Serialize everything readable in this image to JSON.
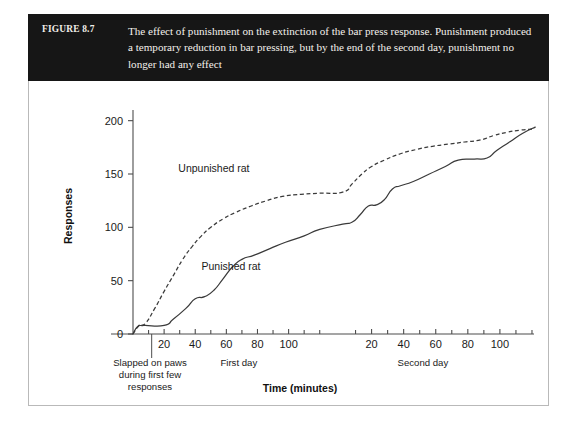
{
  "figure": {
    "number_label": "FIGURE 8.7",
    "caption": "The effect of punishment on the extinction of the bar press response. Punishment produced a temporary reduction in bar pressing, but by the end of the second day, punishment no longer had any effect",
    "header_bg": "#161616",
    "header_text_color": "#f4f1ec",
    "frame_border_color": "#b9b9b9"
  },
  "chart_data": {
    "type": "line",
    "title": "",
    "xlabel": "Time (minutes)",
    "ylabel": "Responses",
    "ylim": [
      0,
      210
    ],
    "yticks": [
      0,
      50,
      100,
      150,
      200
    ],
    "ytick_labels": [
      "0",
      "50",
      "100",
      "150",
      "200"
    ],
    "grid": false,
    "legend": "inline-annotations",
    "x_segments": [
      {
        "name": "First day",
        "label": "First day",
        "xlim": [
          0,
          125
        ],
        "ticks": [
          20,
          40,
          60,
          80,
          100
        ],
        "tick_labels": [
          "20",
          "40",
          "60",
          "80",
          "100"
        ],
        "minor_ticks": [
          10,
          30,
          50,
          70,
          90,
          110,
          120
        ]
      },
      {
        "name": "Second day",
        "label": "Second day",
        "xlim": [
          0,
          125
        ],
        "ticks": [
          20,
          40,
          60,
          80,
          100
        ],
        "tick_labels": [
          "20",
          "40",
          "60",
          "80",
          "100"
        ],
        "minor_ticks": [
          10,
          30,
          50,
          70,
          90,
          110,
          120
        ]
      }
    ],
    "annotations": [
      {
        "name": "slapped-note",
        "lines": [
          "Slapped on paws",
          "during first few",
          "responses"
        ],
        "points_to_day": "First day",
        "points_to_x": 12
      }
    ],
    "series": [
      {
        "name": "Unpunished rat",
        "label": "Unpunished rat",
        "style": "dashed",
        "color": "#3a3a3a",
        "label_position": {
          "day": "First day",
          "x": 52,
          "y": 152
        },
        "points": [
          {
            "day": 1,
            "x": 0,
            "y": 0
          },
          {
            "day": 1,
            "x": 4,
            "y": 8
          },
          {
            "day": 1,
            "x": 8,
            "y": 10
          },
          {
            "day": 1,
            "x": 14,
            "y": 24
          },
          {
            "day": 1,
            "x": 20,
            "y": 40
          },
          {
            "day": 1,
            "x": 26,
            "y": 55
          },
          {
            "day": 1,
            "x": 32,
            "y": 70
          },
          {
            "day": 1,
            "x": 38,
            "y": 82
          },
          {
            "day": 1,
            "x": 44,
            "y": 92
          },
          {
            "day": 1,
            "x": 50,
            "y": 100
          },
          {
            "day": 1,
            "x": 58,
            "y": 108
          },
          {
            "day": 1,
            "x": 66,
            "y": 114
          },
          {
            "day": 1,
            "x": 76,
            "y": 120
          },
          {
            "day": 1,
            "x": 86,
            "y": 125
          },
          {
            "day": 1,
            "x": 96,
            "y": 129
          },
          {
            "day": 1,
            "x": 108,
            "y": 131
          },
          {
            "day": 1,
            "x": 120,
            "y": 132
          },
          {
            "day": 2,
            "x": 2,
            "y": 133
          },
          {
            "day": 2,
            "x": 8,
            "y": 141
          },
          {
            "day": 2,
            "x": 14,
            "y": 150
          },
          {
            "day": 2,
            "x": 20,
            "y": 157
          },
          {
            "day": 2,
            "x": 28,
            "y": 163
          },
          {
            "day": 2,
            "x": 38,
            "y": 169
          },
          {
            "day": 2,
            "x": 48,
            "y": 173
          },
          {
            "day": 2,
            "x": 58,
            "y": 176
          },
          {
            "day": 2,
            "x": 68,
            "y": 178
          },
          {
            "day": 2,
            "x": 78,
            "y": 180
          },
          {
            "day": 2,
            "x": 88,
            "y": 182
          },
          {
            "day": 2,
            "x": 96,
            "y": 186
          },
          {
            "day": 2,
            "x": 104,
            "y": 189
          },
          {
            "day": 2,
            "x": 112,
            "y": 191
          },
          {
            "day": 2,
            "x": 120,
            "y": 192
          }
        ]
      },
      {
        "name": "Punished rat",
        "label": "Punished rat",
        "style": "solid",
        "color": "#3a3a3a",
        "label_position": {
          "day": "First day",
          "x": 63,
          "y": 60
        },
        "points": [
          {
            "day": 1,
            "x": 0,
            "y": 0
          },
          {
            "day": 1,
            "x": 3,
            "y": 7
          },
          {
            "day": 1,
            "x": 7,
            "y": 8
          },
          {
            "day": 1,
            "x": 20,
            "y": 8
          },
          {
            "day": 1,
            "x": 26,
            "y": 14
          },
          {
            "day": 1,
            "x": 34,
            "y": 24
          },
          {
            "day": 1,
            "x": 40,
            "y": 33
          },
          {
            "day": 1,
            "x": 46,
            "y": 35
          },
          {
            "day": 1,
            "x": 52,
            "y": 41
          },
          {
            "day": 1,
            "x": 58,
            "y": 52
          },
          {
            "day": 1,
            "x": 64,
            "y": 63
          },
          {
            "day": 1,
            "x": 70,
            "y": 70
          },
          {
            "day": 1,
            "x": 78,
            "y": 74
          },
          {
            "day": 1,
            "x": 88,
            "y": 80
          },
          {
            "day": 1,
            "x": 98,
            "y": 86
          },
          {
            "day": 1,
            "x": 110,
            "y": 92
          },
          {
            "day": 1,
            "x": 120,
            "y": 98
          },
          {
            "day": 2,
            "x": 2,
            "y": 103
          },
          {
            "day": 2,
            "x": 8,
            "y": 105
          },
          {
            "day": 2,
            "x": 13,
            "y": 112
          },
          {
            "day": 2,
            "x": 18,
            "y": 120
          },
          {
            "day": 2,
            "x": 23,
            "y": 121
          },
          {
            "day": 2,
            "x": 28,
            "y": 126
          },
          {
            "day": 2,
            "x": 33,
            "y": 136
          },
          {
            "day": 2,
            "x": 38,
            "y": 139
          },
          {
            "day": 2,
            "x": 46,
            "y": 143
          },
          {
            "day": 2,
            "x": 56,
            "y": 150
          },
          {
            "day": 2,
            "x": 66,
            "y": 157
          },
          {
            "day": 2,
            "x": 74,
            "y": 163
          },
          {
            "day": 2,
            "x": 84,
            "y": 164
          },
          {
            "day": 2,
            "x": 92,
            "y": 165
          },
          {
            "day": 2,
            "x": 98,
            "y": 172
          },
          {
            "day": 2,
            "x": 106,
            "y": 180
          },
          {
            "day": 2,
            "x": 114,
            "y": 188
          },
          {
            "day": 2,
            "x": 122,
            "y": 194
          }
        ]
      }
    ]
  }
}
